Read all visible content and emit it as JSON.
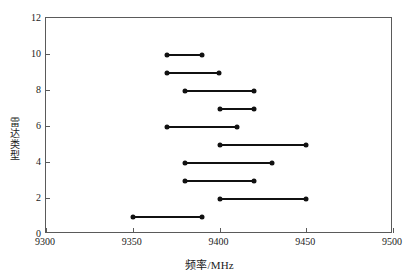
{
  "chart_data": {
    "type": "line",
    "title": "",
    "subtitle": "",
    "xlabel": "频率/MHz",
    "ylabel": "雷达类型",
    "xlim": [
      9300,
      9500
    ],
    "ylim": [
      0,
      12
    ],
    "xticks": [
      9300,
      9350,
      9400,
      9450,
      9500
    ],
    "yticks": [
      0,
      2,
      4,
      6,
      8,
      10,
      12
    ],
    "xticklabels": [
      "9300",
      "9350",
      "9400",
      "9450",
      "9500"
    ],
    "yticklabels": [
      "0",
      "2",
      "4",
      "6",
      "8",
      "10",
      "12"
    ],
    "grid": false,
    "legend": null,
    "marker": "filled-circle",
    "series_description": "Each radar type is drawn as a horizontal segment spanning its frequency band, with filled circle markers at both endpoints.",
    "categories": [
      1,
      2,
      3,
      4,
      5,
      6,
      7,
      8,
      9,
      10
    ],
    "ranges": [
      {
        "radar_type": 1,
        "start": 9350,
        "end": 9390,
        "width": 40
      },
      {
        "radar_type": 2,
        "start": 9400,
        "end": 9450,
        "width": 50
      },
      {
        "radar_type": 3,
        "start": 9380,
        "end": 9420,
        "width": 40
      },
      {
        "radar_type": 4,
        "start": 9380,
        "end": 9430,
        "width": 50
      },
      {
        "radar_type": 5,
        "start": 9400,
        "end": 9450,
        "width": 50
      },
      {
        "radar_type": 6,
        "start": 9370,
        "end": 9410,
        "width": 40
      },
      {
        "radar_type": 7,
        "start": 9400,
        "end": 9420,
        "width": 20
      },
      {
        "radar_type": 8,
        "start": 9380,
        "end": 9420,
        "width": 40
      },
      {
        "radar_type": 9,
        "start": 9370,
        "end": 9400,
        "width": 30
      },
      {
        "radar_type": 10,
        "start": 9370,
        "end": 9390,
        "width": 20
      }
    ]
  },
  "style": {
    "line_color": "#111111",
    "marker_color": "#111111",
    "frame_color": "#5a5a5a",
    "text_color": "#1a1a1a",
    "background": "#ffffff"
  }
}
